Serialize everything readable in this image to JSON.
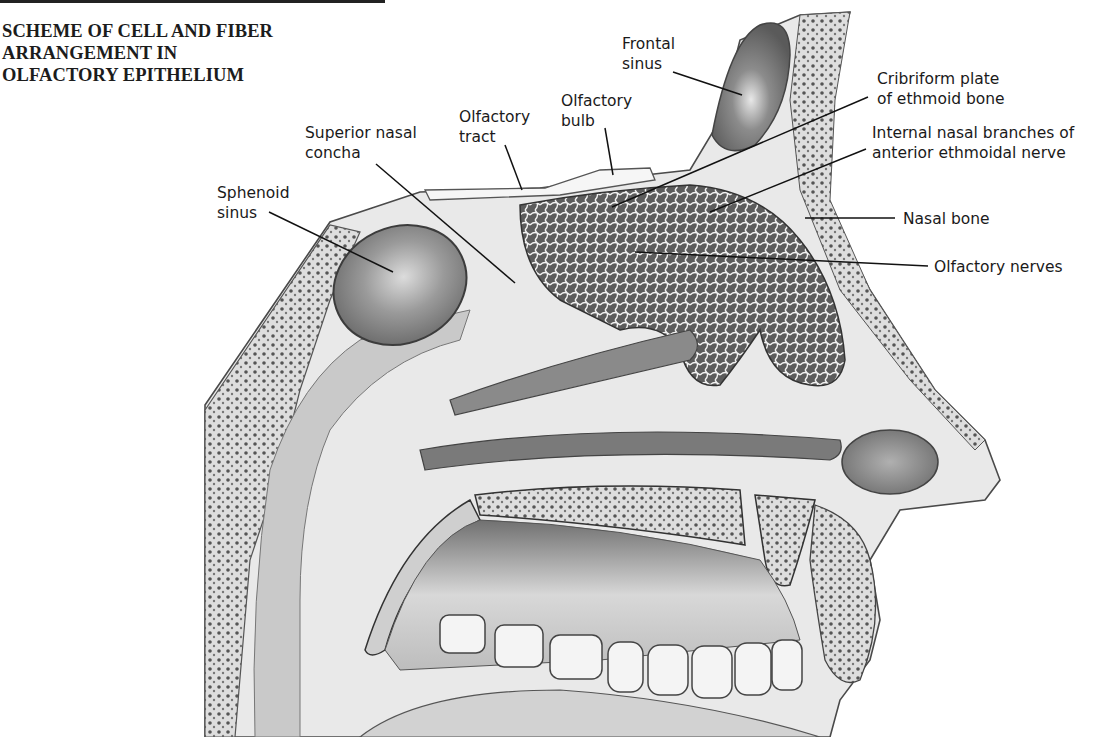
{
  "figure": {
    "title_lines": [
      "SCHEME OF CELL AND FIBER",
      "ARRANGEMENT IN",
      "OLFACTORY EPITHELIUM"
    ]
  },
  "labels": {
    "frontal_sinus": [
      "Frontal",
      "sinus"
    ],
    "cribriform_plate": [
      "Cribriform plate",
      "of ethmoid bone"
    ],
    "internal_nasal_branches": [
      "Internal nasal branches of",
      "anterior ethmoidal nerve"
    ],
    "nasal_bone": [
      "Nasal bone"
    ],
    "olfactory_nerves": [
      "Olfactory nerves"
    ],
    "olfactory_bulb": [
      "Olfactory",
      "bulb"
    ],
    "olfactory_tract": [
      "Olfactory",
      "tract"
    ],
    "superior_nasal_concha": [
      "Superior nasal",
      "concha"
    ],
    "sphenoid_sinus": [
      "Sphenoid",
      "sinus"
    ]
  },
  "colors": {
    "ink": "#1a1a1a",
    "tissue_light": "#e6e6e6",
    "tissue_mid": "#bdbdbd",
    "tissue_dark": "#7a7a7a",
    "background": "#ffffff"
  }
}
